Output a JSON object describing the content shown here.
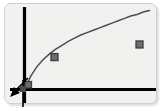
{
  "figure": {
    "title": "",
    "frame": {
      "background_color": "#f1f1f0",
      "border_color": "#cfcfcf",
      "shadow": "soft drop shadow lower-right",
      "corner_radius": "7px"
    },
    "axis": {
      "color": "#000000",
      "x_axis_label": "",
      "y_axis_label": "",
      "tick_labels_x": [],
      "tick_labels_y": [],
      "grid": false
    },
    "cursor": {
      "icon": "arrow-pointer-icon",
      "direction": "down-left",
      "color": "#000000"
    }
  },
  "chart_data": {
    "type": "line",
    "title": "",
    "subtitle": "",
    "xlabel": "",
    "ylabel": "",
    "xlim": [
      0,
      100
    ],
    "ylim": [
      0,
      100
    ],
    "grid": false,
    "legend": false,
    "legend_entries": [],
    "annotations": [],
    "series": [
      {
        "name": "curve",
        "style": "line",
        "color": "#4d4d4d",
        "shape": "concave-down rising curve",
        "x": [
          0,
          5,
          10,
          15,
          20,
          25,
          30,
          35,
          40,
          45,
          50,
          55,
          60,
          65,
          70,
          75,
          80,
          85,
          90,
          95,
          100
        ],
        "y": [
          0,
          17,
          29,
          38,
          45,
          51,
          56,
          61,
          65,
          69,
          72,
          75,
          78,
          81,
          84,
          87,
          90,
          93,
          95,
          98,
          100
        ]
      },
      {
        "name": "markers",
        "style": "scatter",
        "color": "#6e6e6e",
        "marker": "square",
        "x": [
          3,
          24,
          92
        ],
        "y": [
          6,
          41,
          57
        ]
      }
    ]
  }
}
